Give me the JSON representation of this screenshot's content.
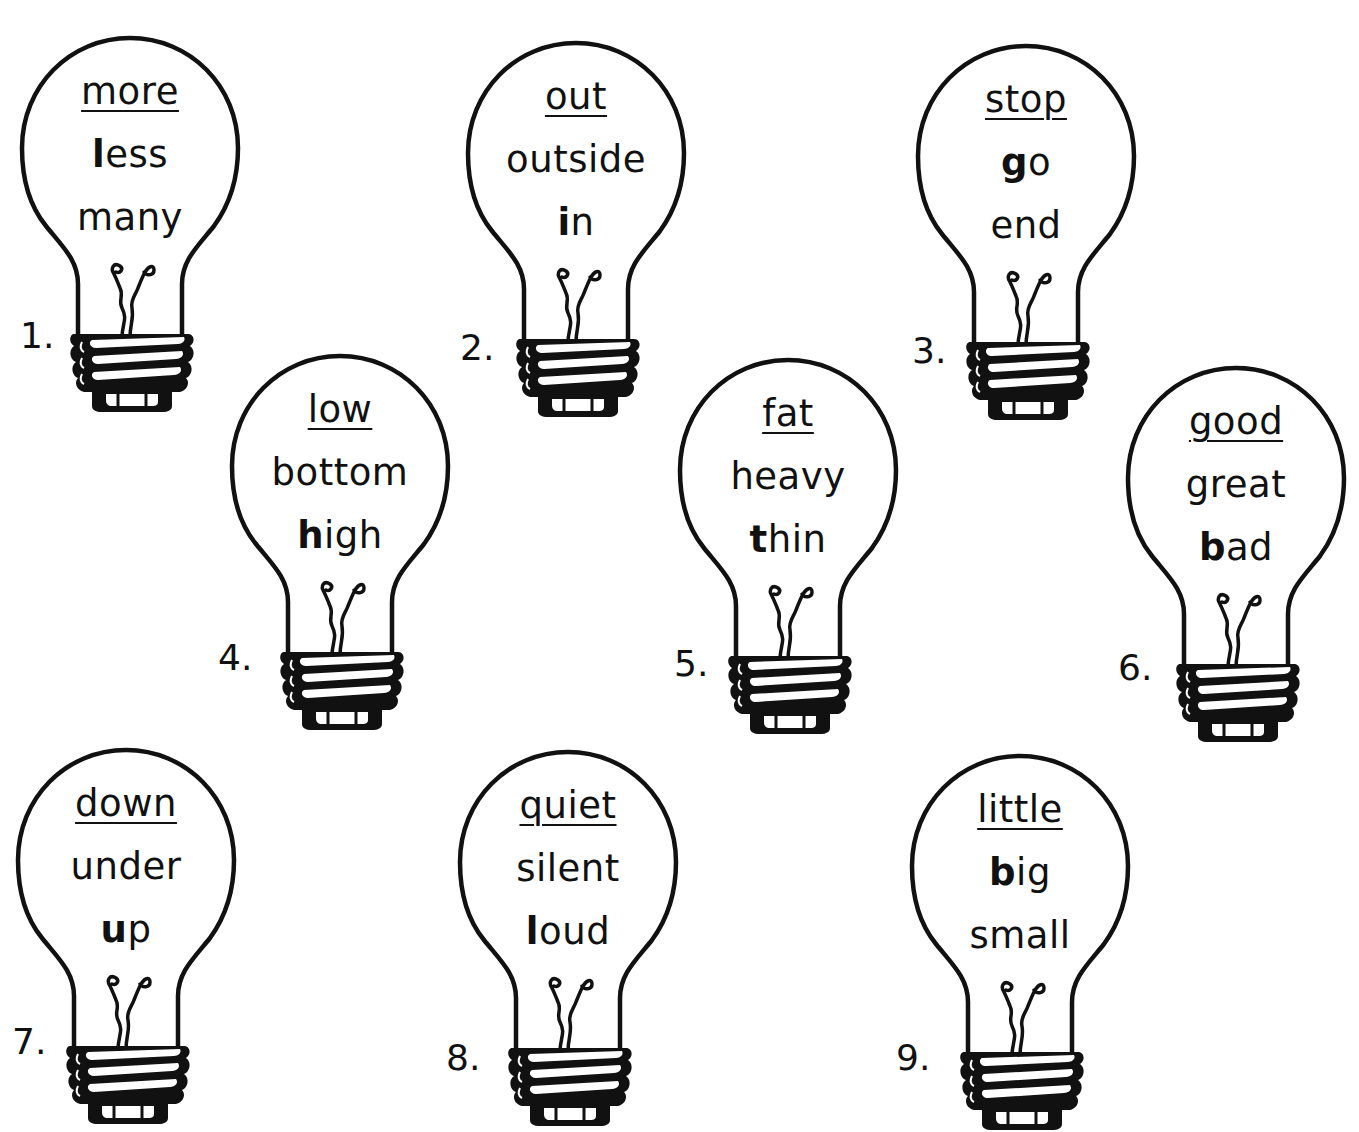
{
  "worksheet": {
    "bulbs": [
      {
        "number": "1.",
        "target": "more",
        "options": [
          {
            "first": "l",
            "rest": "ess",
            "bold_first": true
          },
          {
            "first": "m",
            "rest": "any",
            "bold_first": false
          }
        ]
      },
      {
        "number": "2.",
        "target": "out",
        "options": [
          {
            "first": "o",
            "rest": "utside",
            "bold_first": false
          },
          {
            "first": "i",
            "rest": "n",
            "bold_first": true
          }
        ]
      },
      {
        "number": "3.",
        "target": "stop",
        "options": [
          {
            "first": "g",
            "rest": "o",
            "bold_first": true
          },
          {
            "first": "e",
            "rest": "nd",
            "bold_first": false
          }
        ]
      },
      {
        "number": "4.",
        "target": "low",
        "options": [
          {
            "first": "b",
            "rest": "ottom",
            "bold_first": false
          },
          {
            "first": "h",
            "rest": "igh",
            "bold_first": true
          }
        ]
      },
      {
        "number": "5.",
        "target": "fat",
        "options": [
          {
            "first": "h",
            "rest": "eavy",
            "bold_first": false
          },
          {
            "first": "t",
            "rest": "hin",
            "bold_first": true
          }
        ]
      },
      {
        "number": "6.",
        "target": "good",
        "options": [
          {
            "first": "g",
            "rest": "reat",
            "bold_first": false
          },
          {
            "first": "b",
            "rest": "ad",
            "bold_first": true
          }
        ]
      },
      {
        "number": "7.",
        "target": "down",
        "options": [
          {
            "first": "u",
            "rest": "nder",
            "bold_first": false
          },
          {
            "first": "u",
            "rest": "p",
            "bold_first": true
          }
        ]
      },
      {
        "number": "8.",
        "target": "quiet",
        "options": [
          {
            "first": "s",
            "rest": "ilent",
            "bold_first": false
          },
          {
            "first": "l",
            "rest": "oud",
            "bold_first": true
          }
        ]
      },
      {
        "number": "9.",
        "target": "little",
        "options": [
          {
            "first": "b",
            "rest": "ig",
            "bold_first": true
          },
          {
            "first": "s",
            "rest": "mall",
            "bold_first": false
          }
        ]
      }
    ]
  },
  "colors": {
    "ink": "#111111",
    "paper": "#ffffff"
  }
}
